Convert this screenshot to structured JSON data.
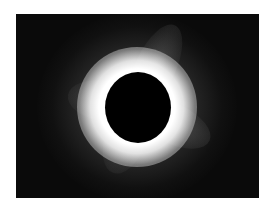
{
  "image": {
    "subject": "total solar eclipse",
    "description": "Black lunar disk surrounded by bright white solar corona against a dark sky",
    "colors": {
      "background": "#ffffff",
      "sky": "#0a0a0a",
      "moon": "#000000",
      "corona": "#ffffff"
    }
  }
}
